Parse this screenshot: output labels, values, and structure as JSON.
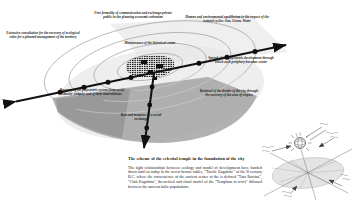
{
  "figure": {
    "type": "scheme-diagram",
    "labels": {
      "communication": "Free formality of communication and exchange private public in the planning economic urbanism",
      "equilibrium": "Human and environmental equilibrium in the respect of the natural cycles: Sun, Green, Water",
      "consultation": "Extensive consultation for the recovery of ecological rules for a planned management of the territory",
      "maintenance": "Maintenance of the historical center",
      "spread": "Spread of the polycentric development through which each periphery becomes center",
      "recovery": "Recovery of the polycentric system from social identity (temple) and of their interrelations",
      "retrieval": "Retrieval of the border of the city through the recovery of the area of respect",
      "network": "Rete and manners of a social exchange"
    },
    "caption": {
      "title": "The scheme of the celestial temple in the foundation of the city",
      "body": "The tight relationships between ecology and model of development have handed down until us today in the seven bronze tables, \"Tavole Eugubine\" of the II century B.C. where the convenience of the ancient center of the is defined \"Tota Ikuvina\", \"Città Eugubina\", theoretical and ritual model of the \"Templum in terris\" diffused between the ancient italic populations."
    },
    "icons": {
      "inset": "celestial-temple-inset",
      "globe": "globe-icon",
      "city": "city-plan-icon"
    },
    "colors": {
      "axis": "#111111",
      "ring_stroke": "#8a8a8a",
      "shadow_fan": "#a3a3a3",
      "light_plane": "#e6e6e6",
      "respect_disc": "#d9d9d9",
      "text": "#1b1b1b",
      "background": "#ffffff"
    }
  }
}
